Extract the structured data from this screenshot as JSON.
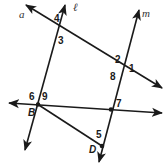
{
  "figure": {
    "lines": {
      "a": "a",
      "l": "ℓ",
      "m": "m"
    },
    "points": {
      "B": "B",
      "D": "D"
    },
    "angles": [
      "1",
      "2",
      "3",
      "4",
      "5",
      "6",
      "7",
      "8",
      "9"
    ],
    "colors": {
      "stroke": "#1a1a1a",
      "background": "#ffffff"
    }
  }
}
